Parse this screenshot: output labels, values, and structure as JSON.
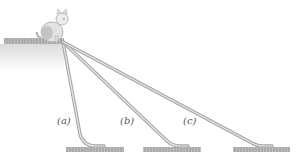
{
  "figure": {
    "slides": [
      {
        "id": "a",
        "label": "(a)"
      },
      {
        "id": "b",
        "label": "(b)"
      },
      {
        "id": "c",
        "label": "(c)"
      }
    ],
    "colors": {
      "slide": "#b8b8b8",
      "slide_highlight": "#e6e6e6",
      "grass": "#a9a9a9",
      "ledge_fade": "#e8e8e8",
      "cat_body": "#d9d9d9",
      "cat_outline": "#9a9a9a"
    }
  }
}
